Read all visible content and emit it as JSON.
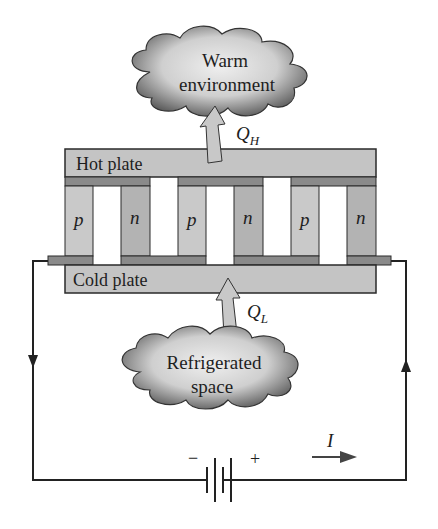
{
  "diagram": {
    "warm_cloud": {
      "line1": "Warm",
      "line2": "environment"
    },
    "cold_cloud": {
      "line1": "Refrigerated",
      "line2": "space"
    },
    "hot_plate_label": "Hot plate",
    "cold_plate_label": "Cold plate",
    "heat_out": {
      "symbol": "Q",
      "subscript": "H"
    },
    "heat_in": {
      "symbol": "Q",
      "subscript": "L"
    },
    "legs": [
      "p",
      "n",
      "p",
      "n",
      "p",
      "n"
    ],
    "battery": {
      "minus": "−",
      "plus": "+"
    },
    "current_label": "I",
    "colors": {
      "plate": "#c4c4c4",
      "p_leg": "#c9c9c9",
      "n_leg": "#b3b3b3",
      "conductor": "#8a8a8a",
      "outline": "#2a2a2a",
      "cloud_dark": "#5a5a5a",
      "cloud_light": "#e8e8e8",
      "arrow": "#c8c8c8"
    }
  }
}
